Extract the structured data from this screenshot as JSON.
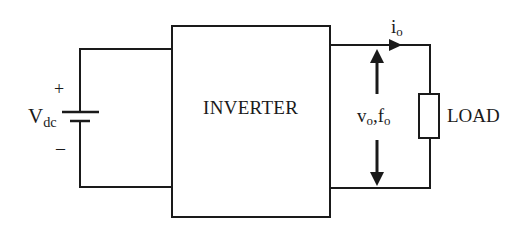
{
  "diagram": {
    "type": "inverter-block-diagram",
    "source": {
      "label": "V",
      "label_sub": "dc",
      "plus": "+",
      "minus": "–"
    },
    "block": {
      "label": "INVERTER"
    },
    "output": {
      "voltage_label": "v",
      "voltage_sub": "o",
      "separator": ",",
      "freq_label": "f",
      "freq_sub": "o",
      "current_label": "i",
      "current_sub": "o"
    },
    "load": {
      "label": "LOAD"
    },
    "colors": {
      "line": "#1a1a1a",
      "background": "#ffffff"
    }
  }
}
